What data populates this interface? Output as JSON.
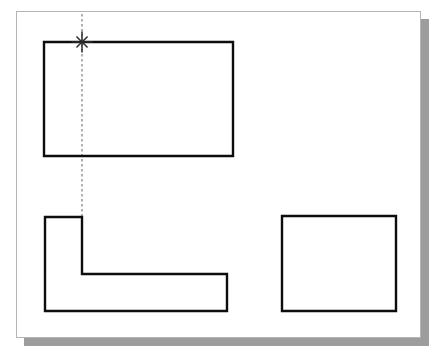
{
  "app": {
    "title": "CAD Drawing Canvas",
    "canvas_label": "drawing-sheet"
  },
  "canvas": {
    "width": 405,
    "height": 327,
    "left": 16,
    "top": 11,
    "background_color": "#ffffff",
    "border_color": "#b5b5b5",
    "shadow_color": "#9d9d9d",
    "shadow_offset": 8
  },
  "grid": {
    "type": "dot-grid",
    "dot_color": "#b9b9b9",
    "spacing_x": 20,
    "spacing_y": 19,
    "visible": true
  },
  "style": {
    "object_line_color": "#0d0d0d",
    "object_line_width": 2.4,
    "tracking_line_color": "#6f6f6f",
    "tracking_line_width": 1.1,
    "tracking_dash_pattern": "2.6 2.4",
    "snap_marker_color": "#2b2b2b"
  },
  "shapes": [
    {
      "name": "top-rectangle",
      "type": "rectangle",
      "closed": true,
      "points": "43,41 232,41 232,155 43,155"
    },
    {
      "name": "l-shape-polygon",
      "type": "polyline",
      "closed": true,
      "points": "44,216 81,216 81,273 226,273 226,310 44,310"
    },
    {
      "name": "right-rectangle",
      "type": "rectangle",
      "closed": true,
      "points": "281,215 395,215 395,310 281,310"
    }
  ],
  "tracking": {
    "name": "vertical-tracking-line",
    "x": 81,
    "y_start": 13,
    "y_end": 216,
    "orientation": "vertical"
  },
  "snap_marker": {
    "name": "snap-marker",
    "glyph": "asterisk-star",
    "x": 81,
    "y": 41,
    "radius": 10,
    "ray_count": 8
  }
}
